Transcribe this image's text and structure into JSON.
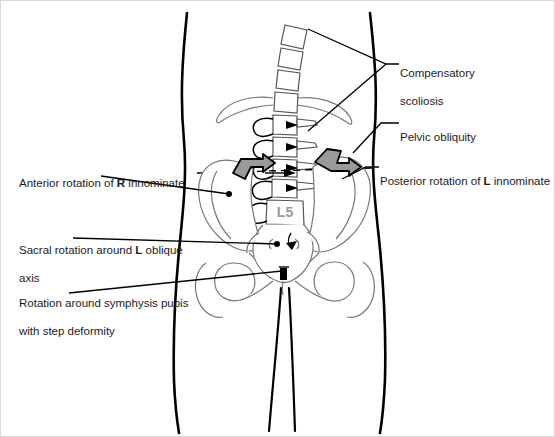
{
  "figure": {
    "border_color": "#d8d8d8",
    "background": "#ffffff",
    "outline_color": "#000000",
    "bone_color": "#555555",
    "arrow_fill": "#9a9a9a",
    "label_color": "#1a1a1a"
  },
  "bone_labels": {
    "l5": "L5"
  },
  "annotations": [
    {
      "id": "compensatory-scoliosis",
      "side": "right",
      "line1": "Compensatory",
      "line2": "scoliosis",
      "bold_token": ""
    },
    {
      "id": "pelvic-obliquity",
      "side": "right",
      "line1": "Pelvic obliquity",
      "line2": "",
      "bold_token": ""
    },
    {
      "id": "posterior-rotation-left-innominate",
      "side": "right",
      "prefix": "Posterior rotation of ",
      "bold_token": "L",
      "suffix": " innominate"
    },
    {
      "id": "anterior-rotation-right-innominate",
      "side": "left",
      "prefix": "Anterior rotation of ",
      "bold_token": "R",
      "suffix": " innominate"
    },
    {
      "id": "sacral-rotation-left-oblique-axis",
      "side": "left",
      "prefix": "Sacral rotation around ",
      "bold_token": "L",
      "suffix": " oblique",
      "line2": "axis"
    },
    {
      "id": "rotation-symphysis-pubis",
      "side": "left",
      "line1": "Rotation around symphysis pubis",
      "line2": "with step deformity",
      "bold_token": ""
    }
  ]
}
